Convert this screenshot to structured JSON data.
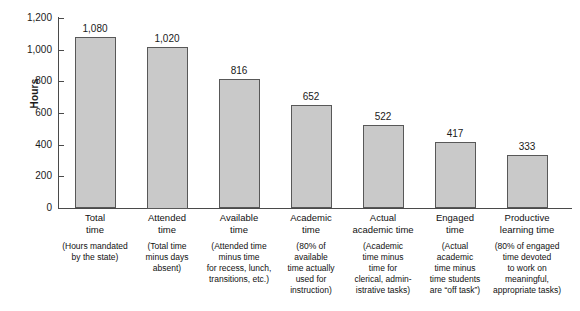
{
  "chart_data": {
    "type": "bar",
    "title": "",
    "xlabel": "",
    "ylabel": "Hours",
    "ylim": [
      0,
      1200
    ],
    "yticks": [
      0,
      200,
      400,
      600,
      800,
      1000,
      1200
    ],
    "ytick_labels": [
      "0",
      "200",
      "400",
      "600",
      "800",
      "1,000",
      "1,200"
    ],
    "grid": false,
    "legend": null,
    "categories": [
      "Total\ntime",
      "Attended\ntime",
      "Available\ntime",
      "Academic\ntime",
      "Actual\nacademic time",
      "Engaged\ntime",
      "Productive\nlearning time"
    ],
    "category_descriptions": [
      "(Hours mandated\nby the state)",
      "(Total time\nminus days\nabsent)",
      "(Attended time\nminus time\nfor recess, lunch,\ntransitions, etc.)",
      "(80% of\navailable\ntime actually\nused for\ninstruction)",
      "(Academic\ntime minus\ntime for\nclerical, admin-\nistrative tasks)",
      "(Actual\nacademic\ntime minus\ntime students\nare “off task”)",
      "(80% of engaged\ntime devoted\nto work on\nmeaningful,\nappropriate tasks)"
    ],
    "values": [
      1080,
      1020,
      816,
      652,
      522,
      417,
      333
    ],
    "value_labels": [
      "1,080",
      "1,020",
      "816",
      "652",
      "522",
      "417",
      "333"
    ],
    "bar_fill_color": "#c9c9c9",
    "bar_border_color": "#585858",
    "axis_color": "#4a4a4a",
    "background_color": "#ffffff"
  }
}
